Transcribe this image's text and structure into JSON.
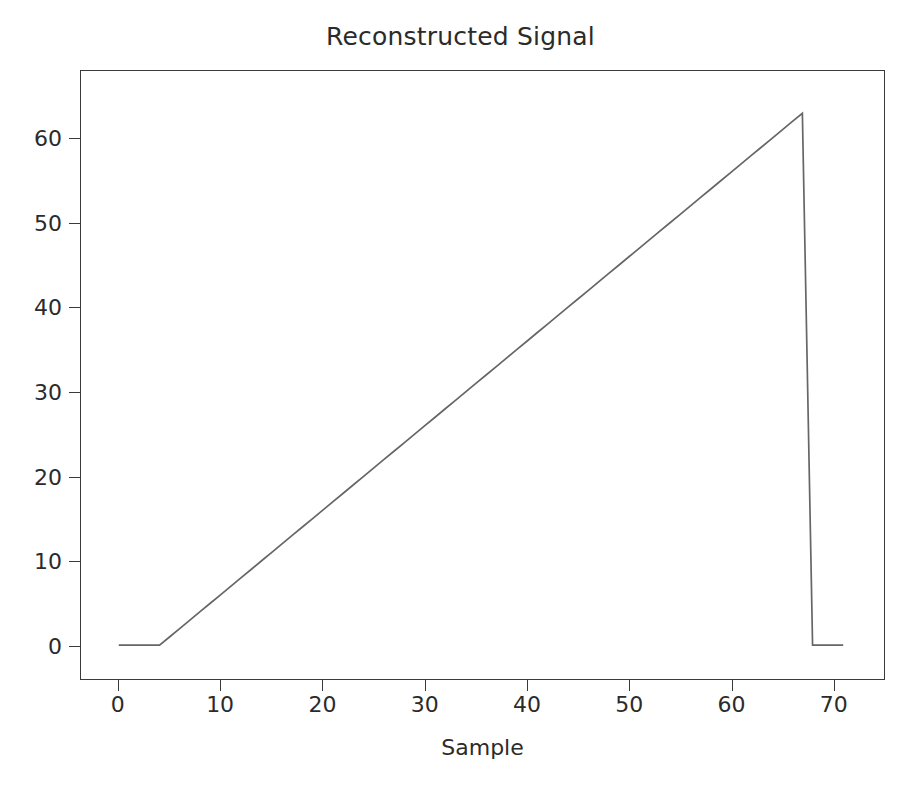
{
  "chart_data": {
    "type": "line",
    "title": "Reconstructed Signal",
    "xlabel": "Sample",
    "ylabel": "",
    "xlim": [
      -3.7,
      75.0
    ],
    "ylim": [
      -4.0,
      68.0
    ],
    "grid": false,
    "legend": null,
    "line_color": "#666666",
    "line_width": 1.6,
    "xticks": [
      0,
      10,
      20,
      30,
      40,
      50,
      60,
      70
    ],
    "xtick_labels": [
      "0",
      "10",
      "20",
      "30",
      "40",
      "50",
      "60",
      "70"
    ],
    "yticks": [
      0,
      10,
      20,
      30,
      40,
      50,
      60
    ],
    "ytick_labels": [
      "0",
      "10",
      "20",
      "30",
      "40",
      "50",
      "60"
    ],
    "series": [
      {
        "name": "reconstructed",
        "x": [
          0,
          1,
          2,
          3,
          4,
          5,
          6,
          7,
          8,
          9,
          10,
          11,
          12,
          13,
          14,
          15,
          16,
          17,
          18,
          19,
          20,
          21,
          22,
          23,
          24,
          25,
          26,
          27,
          28,
          29,
          30,
          31,
          32,
          33,
          34,
          35,
          36,
          37,
          38,
          39,
          40,
          41,
          42,
          43,
          44,
          45,
          46,
          47,
          48,
          49,
          50,
          51,
          52,
          53,
          54,
          55,
          56,
          57,
          58,
          59,
          60,
          61,
          62,
          63,
          64,
          65,
          66,
          67,
          68,
          69,
          70,
          71
        ],
        "y": [
          0,
          0,
          0,
          0,
          0,
          1,
          2,
          3,
          4,
          5,
          6,
          7,
          8,
          9,
          10,
          11,
          12,
          13,
          14,
          15,
          16,
          17,
          18,
          19,
          20,
          21,
          22,
          23,
          24,
          25,
          26,
          27,
          28,
          29,
          30,
          31,
          32,
          33,
          34,
          35,
          36,
          37,
          38,
          39,
          40,
          41,
          42,
          43,
          44,
          45,
          46,
          47,
          48,
          49,
          50,
          51,
          52,
          53,
          54,
          55,
          56,
          57,
          58,
          59,
          60,
          61,
          62,
          63,
          0,
          0,
          0,
          0
        ]
      }
    ]
  },
  "figure": {
    "background": "#ffffff",
    "axes_edge_color": "#3a3a3a",
    "tick_color": "#3a3a3a",
    "text_color": "#2b2b2b"
  }
}
